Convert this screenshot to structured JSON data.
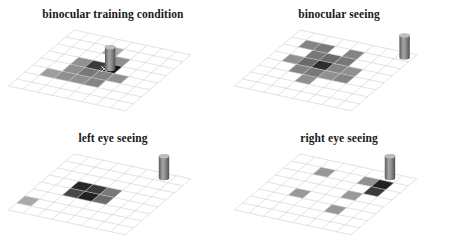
{
  "figure": {
    "background_color": "#ffffff",
    "panel_count": 4,
    "grid_rows": 8,
    "grid_cols": 8,
    "gridline_color": "#c9c9c9",
    "cylinder": {
      "name": "landmark-cylinder",
      "body_color": "#8a8a8a",
      "body_color_dark": "#5c5c5c",
      "top_color": "#bdbdbd"
    }
  },
  "chart_data": {
    "type": "heatmap",
    "xlabel": "",
    "ylabel": "",
    "grid": true,
    "legend_position": "none",
    "projection": "oblique 3D floor plane, 8 x 8 cells",
    "value_range": [
      0,
      1
    ],
    "colormap": "grayscale, 0 = white (no search), 1 = black (maximum search density)",
    "panels": [
      {
        "id": "binocular-training-condition",
        "title": "binocular training condition",
        "has_marker": true,
        "marker_label": "x",
        "cylinder_cell": [
          3,
          4
        ],
        "values": [
          [
            0,
            0,
            0,
            0,
            0,
            0,
            0,
            0
          ],
          [
            0,
            0,
            0,
            0.35,
            0,
            0,
            0,
            0
          ],
          [
            0,
            0,
            0,
            0,
            0.45,
            0,
            0,
            0
          ],
          [
            0,
            0,
            0.45,
            0.8,
            0.95,
            0,
            0,
            0
          ],
          [
            0,
            0,
            0.45,
            0.55,
            0.5,
            0.45,
            0,
            0
          ],
          [
            0,
            0.4,
            0.45,
            0.45,
            0.5,
            0,
            0,
            0
          ],
          [
            0,
            0,
            0,
            0,
            0,
            0,
            0,
            0
          ],
          [
            0,
            0,
            0,
            0,
            0,
            0,
            0,
            0
          ]
        ]
      },
      {
        "id": "binocular-seeing",
        "title": "binocular seeing",
        "has_marker": false,
        "cylinder_cell": [
          0,
          7
        ],
        "values": [
          [
            0,
            0,
            0,
            0,
            0,
            0,
            0,
            0
          ],
          [
            0,
            0.5,
            0.55,
            0,
            0.5,
            0,
            0,
            0
          ],
          [
            0,
            0,
            0.55,
            0.6,
            0.55,
            0,
            0,
            0
          ],
          [
            0,
            0.45,
            0.6,
            0.85,
            0.5,
            0.45,
            0,
            0
          ],
          [
            0,
            0,
            0.5,
            0.55,
            0.45,
            0.5,
            0,
            0
          ],
          [
            0,
            0,
            0,
            0.45,
            0,
            0,
            0,
            0
          ],
          [
            0,
            0,
            0,
            0,
            0,
            0,
            0,
            0
          ],
          [
            0,
            0,
            0,
            0,
            0,
            0,
            0,
            0
          ]
        ]
      },
      {
        "id": "left-eye-seeing",
        "title": "left eye seeing",
        "has_marker": false,
        "cylinder_cell": [
          0,
          6
        ],
        "values": [
          [
            0,
            0,
            0,
            0,
            0,
            0,
            0,
            0
          ],
          [
            0,
            0,
            0,
            0,
            0,
            0,
            0,
            0
          ],
          [
            0,
            0,
            0,
            0,
            0,
            0,
            0,
            0
          ],
          [
            0,
            0,
            0.88,
            0.8,
            0.55,
            0,
            0,
            0
          ],
          [
            0,
            0,
            0.75,
            0.9,
            0.6,
            0,
            0,
            0
          ],
          [
            0,
            0,
            0,
            0,
            0,
            0,
            0,
            0
          ],
          [
            0.35,
            0,
            0,
            0,
            0,
            0,
            0,
            0
          ],
          [
            0,
            0,
            0,
            0,
            0,
            0,
            0,
            0
          ]
        ]
      },
      {
        "id": "right-eye-seeing",
        "title": "right eye seeing",
        "has_marker": false,
        "cylinder_cell": [
          0,
          6
        ],
        "values": [
          [
            0,
            0,
            0,
            0,
            0,
            0,
            0,
            0
          ],
          [
            0,
            0,
            0.42,
            0,
            0,
            0.45,
            0.9,
            0
          ],
          [
            0,
            0,
            0,
            0,
            0,
            0,
            0.8,
            0
          ],
          [
            0,
            0,
            0,
            0,
            0,
            0.42,
            0,
            0
          ],
          [
            0,
            0,
            0.42,
            0,
            0,
            0,
            0,
            0
          ],
          [
            0,
            0,
            0,
            0,
            0,
            0.42,
            0,
            0
          ],
          [
            0,
            0,
            0,
            0,
            0,
            0,
            0,
            0
          ],
          [
            0,
            0,
            0,
            0,
            0,
            0,
            0,
            0
          ]
        ]
      }
    ]
  }
}
